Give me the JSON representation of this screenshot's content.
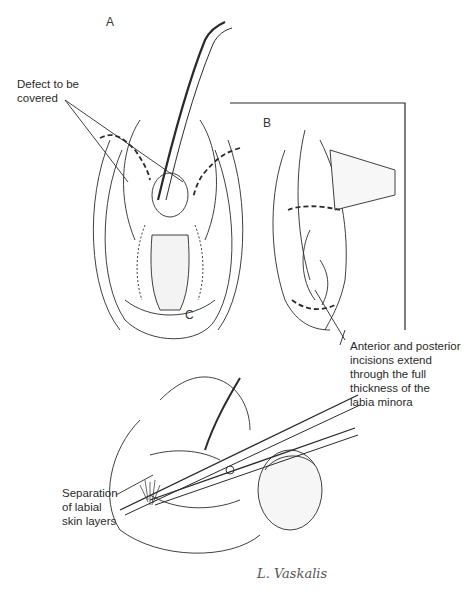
{
  "figure": {
    "panels": [
      {
        "id": "A",
        "label": "A"
      },
      {
        "id": "B",
        "label": "B"
      },
      {
        "id": "C",
        "label": "C"
      }
    ],
    "callouts": {
      "defect": [
        "Defect to be",
        "covered"
      ],
      "incisions": [
        "Anterior and posterior",
        "incisions extend",
        "through the full",
        "thickness of the",
        "labia minora"
      ],
      "separation": [
        "Separation",
        "of labial",
        "skin layers"
      ]
    },
    "signature": "L. Vaskalis",
    "colors": {
      "line": "#2a2a2a",
      "background": "#ffffff",
      "hatch": "#6b6b6b"
    }
  }
}
